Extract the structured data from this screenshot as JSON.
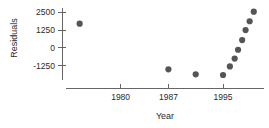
{
  "chart_data": {
    "type": "scatter",
    "title": "",
    "subtitle": "",
    "xlabel": "Year",
    "ylabel": "Residuals",
    "xlim": [
      1972,
      2001
    ],
    "ylim": [
      -2250,
      2800
    ],
    "grid": false,
    "legend": null,
    "xticks": [
      1980,
      1987,
      1995
    ],
    "xtick_labels": [
      "1980",
      "1987",
      "1995"
    ],
    "yticks": [
      -1250,
      0,
      1250,
      2500
    ],
    "ytick_labels": [
      "-1250",
      "0",
      "1250",
      "2500"
    ],
    "marker": {
      "shape": "circle",
      "color": "#555555",
      "size": 3.1
    },
    "axis_color": "#555555",
    "series": [
      {
        "name": "Residuals",
        "x": [
          1974.0,
          1987.0,
          1991.0,
          1995.0,
          1996.0,
          1996.7,
          1997.2,
          1997.8,
          1998.3,
          1998.9,
          1999.5
        ],
        "y": [
          1700,
          -1500,
          -1850,
          -1900,
          -1300,
          -750,
          -130,
          550,
          1250,
          1870,
          2540
        ]
      }
    ],
    "annotations": []
  },
  "axes_geometry": {
    "y_axis_x": 62,
    "x_axis_y": 88,
    "x_axis_left": 66,
    "x_axis_right": 264,
    "y_axis_top": 8,
    "y_axis_bottom": 80,
    "tick_len": 4
  }
}
